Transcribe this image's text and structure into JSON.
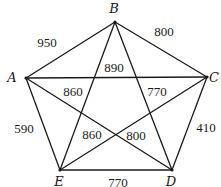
{
  "graph": {
    "vertices": [
      {
        "id": "A",
        "label": "A",
        "x": 26,
        "y": 78,
        "lx": 12,
        "ly": 82
      },
      {
        "id": "B",
        "label": "B",
        "x": 115,
        "y": 22,
        "lx": 114,
        "ly": 13
      },
      {
        "id": "C",
        "label": "C",
        "x": 207,
        "y": 77,
        "lx": 214,
        "ly": 82
      },
      {
        "id": "D",
        "label": "D",
        "x": 172,
        "y": 170,
        "lx": 171,
        "ly": 186
      },
      {
        "id": "E",
        "label": "E",
        "x": 60,
        "y": 170,
        "lx": 59,
        "ly": 186
      }
    ],
    "edges": [
      {
        "from": "A",
        "to": "B",
        "weight": "950",
        "lx": 47,
        "ly": 47
      },
      {
        "from": "B",
        "to": "C",
        "weight": "800",
        "lx": 164,
        "ly": 36
      },
      {
        "from": "A",
        "to": "C",
        "weight": "890",
        "lx": 114,
        "ly": 72
      },
      {
        "from": "B",
        "to": "E",
        "weight": "860",
        "lx": 73,
        "ly": 96
      },
      {
        "from": "B",
        "to": "D",
        "weight": "770",
        "lx": 157,
        "ly": 96
      },
      {
        "from": "A",
        "to": "E",
        "weight": "590",
        "lx": 24,
        "ly": 133
      },
      {
        "from": "C",
        "to": "E",
        "weight": "860",
        "lx": 92,
        "ly": 139
      },
      {
        "from": "A",
        "to": "D",
        "weight": "800",
        "lx": 136,
        "ly": 140
      },
      {
        "from": "C",
        "to": "D",
        "weight": "410",
        "lx": 206,
        "ly": 132
      },
      {
        "from": "E",
        "to": "D",
        "weight": "770",
        "lx": 118,
        "ly": 187
      }
    ]
  }
}
